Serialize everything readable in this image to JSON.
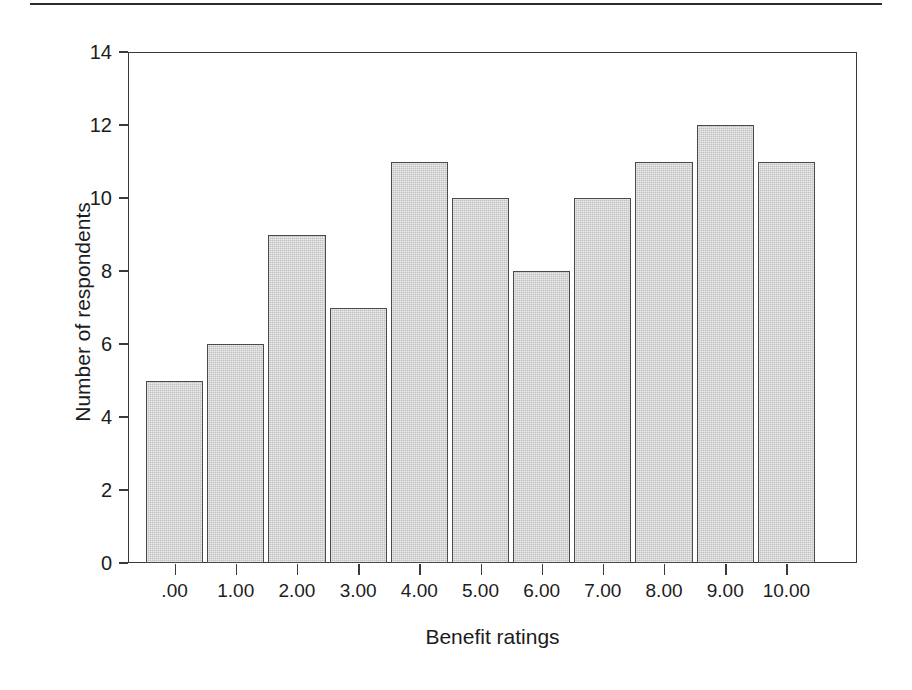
{
  "figure": {
    "name": "benefit-ratings-histogram"
  },
  "chart_data": {
    "type": "bar",
    "title": "",
    "subtitle": "",
    "xlabel": "Benefit ratings",
    "ylabel": "Number of respondents",
    "categories": [
      ".00",
      "1.00",
      "2.00",
      "3.00",
      "4.00",
      "5.00",
      "6.00",
      "7.00",
      "8.00",
      "9.00",
      "10.00"
    ],
    "values": [
      5,
      6,
      9,
      7,
      11,
      10,
      8,
      10,
      11,
      12,
      11
    ],
    "ylim": [
      0,
      14
    ],
    "ytick_values": [
      0,
      2,
      4,
      6,
      8,
      10,
      12,
      14
    ],
    "ytick_labels": [
      "0",
      "2",
      "4",
      "6",
      "8",
      "10",
      "12",
      "14"
    ],
    "grid": false,
    "legend": false,
    "legend_position": "none",
    "bar_fill_color": "#cfcfcf",
    "bar_edge_color": "#4a4a4a",
    "axis_color": "#3a3a3a",
    "background_color": "#ffffff"
  }
}
